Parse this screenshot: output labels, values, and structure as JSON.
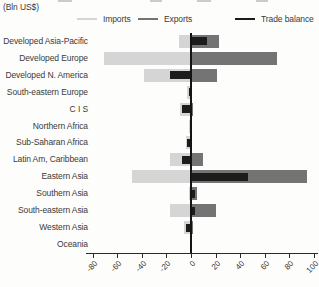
{
  "header": {
    "units_label": "(Bln US$)"
  },
  "legend": {
    "position": "top",
    "items": [
      {
        "label": "Imports",
        "color": "#d5d5d5"
      },
      {
        "label": "Exports",
        "color": "#747474"
      },
      {
        "label": "Trade balance",
        "color": "#1c1c1c"
      }
    ]
  },
  "chart_data": {
    "type": "bar",
    "orientation": "horizontal",
    "title": "",
    "xlabel": "(Bln US$)",
    "ylabel": "",
    "xlim": [
      -80,
      100
    ],
    "xticks": [
      -80,
      -60,
      -40,
      -20,
      0,
      20,
      40,
      60,
      80,
      100
    ],
    "grid": false,
    "legend_position": "top",
    "categories": [
      "Developed Asia-Pacific",
      "Developed Europe",
      "Developed N. America",
      "South-eastern Europe",
      "C I S",
      "Northern Africa",
      "Sub-Saharan Africa",
      "Latin Am, Caribbean",
      "Eastern Asia",
      "Southern Asia",
      "South-eastern Asia",
      "Western Asia",
      "Oceania"
    ],
    "series": [
      {
        "name": "Imports",
        "color": "#d5d5d5",
        "values": [
          -10,
          -71,
          -38,
          -3,
          -9,
          -2,
          -4,
          -17,
          -48,
          -2,
          -17,
          -6,
          -1
        ]
      },
      {
        "name": "Exports",
        "color": "#747474",
        "values": [
          23,
          70,
          21,
          1,
          2,
          1,
          1,
          10,
          94,
          5,
          20,
          2,
          0.5
        ]
      },
      {
        "name": "Trade balance",
        "color": "#1c1c1c",
        "values": [
          13,
          -1,
          -17,
          -2,
          -7,
          -1,
          -3,
          -7,
          46,
          3,
          3,
          -4,
          -0.5
        ]
      }
    ]
  }
}
